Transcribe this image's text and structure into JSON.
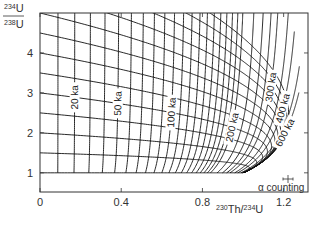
{
  "chart_data": {
    "type": "line",
    "title": "",
    "xlabel": "230Th/234U",
    "xlabel_parts": {
      "sup1": "230",
      "base1": "Th/",
      "sup2": "234",
      "base2": "U"
    },
    "ylabel": "234U/238U",
    "ylabel_parts": {
      "num_sup": "234",
      "num_base": "U",
      "den_sup": "238",
      "den_base": "U"
    },
    "xlim": [
      0,
      1.32
    ],
    "ylim": [
      0.52,
      5.0
    ],
    "x_ticks": [
      {
        "value": 0,
        "label": "0"
      },
      {
        "value": 0.4,
        "label": "0.4"
      },
      {
        "value": 0.8,
        "label": "0.8"
      },
      {
        "value": 1.2,
        "label": "1.2"
      }
    ],
    "y_ticks": [
      {
        "value": 1,
        "label": "1"
      },
      {
        "value": 2,
        "label": "2"
      },
      {
        "value": 3,
        "label": "3"
      },
      {
        "value": 4,
        "label": "4"
      }
    ],
    "grid": false,
    "decay_constants_per_ka": {
      "lambda230": 0.0091577,
      "lambda234": 0.0028263
    },
    "initial_ratio_curves": {
      "description": "Evolution curves for initial 234U/238U activity ratios",
      "initial_ratios": [
        1.0,
        1.5,
        2.0,
        2.5,
        3.0,
        3.5,
        4.0,
        4.5,
        5.0,
        5.5,
        6.0,
        6.5,
        7.0
      ]
    },
    "isochrons": {
      "description": "Lines of equal age (ka)",
      "ages_ka": [
        10,
        20,
        30,
        40,
        50,
        60,
        70,
        80,
        90,
        100,
        110,
        120,
        130,
        140,
        150,
        160,
        170,
        180,
        190,
        200,
        225,
        250,
        275,
        300,
        350,
        400,
        500,
        600
      ],
      "labeled": [
        {
          "age": 20,
          "label": "20 ka",
          "at_initial": 3.0
        },
        {
          "age": 50,
          "label": "50 ka",
          "at_initial": 3.0
        },
        {
          "age": 100,
          "label": "100 ka",
          "at_initial": 3.0
        },
        {
          "age": 200,
          "label": "200 ka",
          "at_initial": 3.0
        },
        {
          "age": 300,
          "label": "300 ka",
          "at_initial": 6.0
        },
        {
          "age": 400,
          "label": "400 ka",
          "at_initial": 6.0
        },
        {
          "age": 600,
          "label": "600 ka",
          "at_initial": 6.5
        }
      ]
    },
    "annotations": [
      {
        "text": "α counting",
        "kind": "error-bar-legend",
        "position": "bottom-right"
      }
    ]
  }
}
